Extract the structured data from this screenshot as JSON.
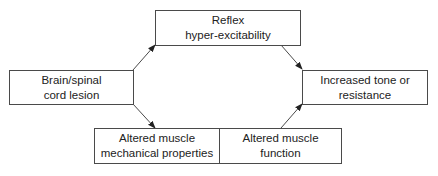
{
  "diagram": {
    "nodes": [
      {
        "id": "reflex",
        "lines": [
          "Reflex",
          "hyper-excitability"
        ]
      },
      {
        "id": "lesion",
        "lines": [
          "Brain/spinal",
          "cord lesion"
        ]
      },
      {
        "id": "tone",
        "lines": [
          "Increased tone or",
          "resistance"
        ]
      },
      {
        "id": "mechanical",
        "lines": [
          "Altered muscle",
          "mechanical properties"
        ]
      },
      {
        "id": "function",
        "lines": [
          "Altered muscle",
          "function"
        ]
      }
    ],
    "edges": [
      {
        "from": "lesion",
        "to": "reflex"
      },
      {
        "from": "reflex",
        "to": "tone"
      },
      {
        "from": "lesion",
        "to": "mechanical"
      },
      {
        "from": "function",
        "to": "tone"
      }
    ],
    "colors": {
      "stroke": "#4a4a4a",
      "text": "#222222",
      "background": "#ffffff"
    }
  }
}
